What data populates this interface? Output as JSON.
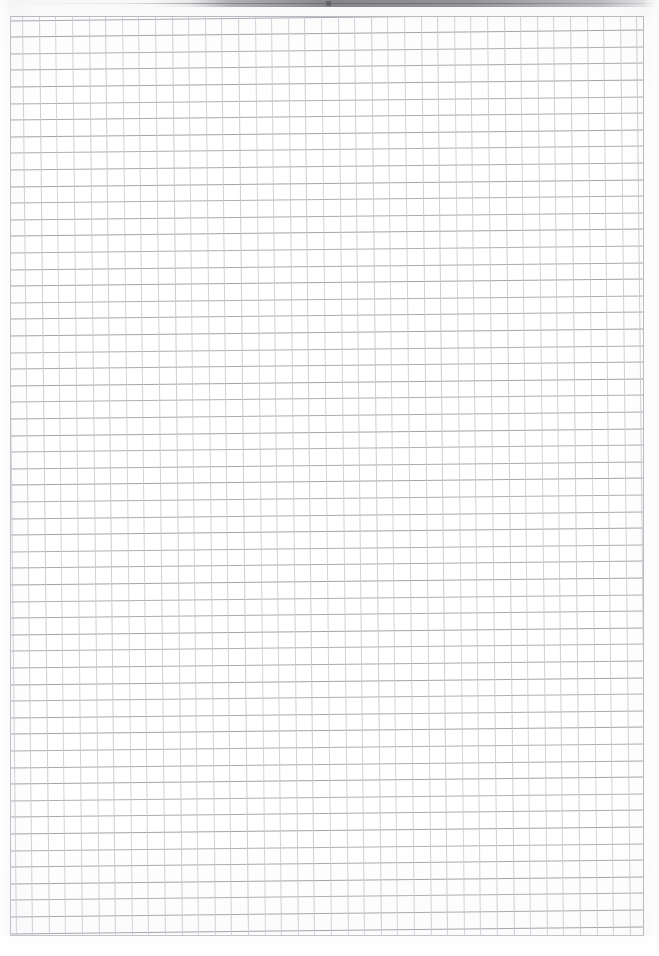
{
  "document": {
    "kind": "scanned-grid-paper",
    "title": "Blank squared notebook page",
    "page_width": 659,
    "page_height": 956,
    "text_content": "",
    "has_text": false,
    "has_handwriting": false,
    "orientation": "portrait"
  },
  "paper": {
    "background_color": "#fefefe",
    "surface_tone": "#fbfbfc",
    "margin_left": 10,
    "margin_top": 16,
    "margin_right": 15,
    "margin_bottom": 20
  },
  "grid": {
    "label": "square grid ruling",
    "cell_size_px": 16.6,
    "origin_x": 10,
    "origin_y": 16,
    "width": 634,
    "height": 920,
    "columns": 38,
    "rows": 55,
    "horizontal_line_color": "#9b9ba2",
    "vertical_line_color": "#c9c9d0",
    "frame_color": "#b9b9c1",
    "line_weight_px": 1,
    "skew_degrees": -0.62
  },
  "scan_artifacts": {
    "top_shadow_label": "scanner lid edge shadow",
    "top_shadow_color": "#6c6c73",
    "top_shadow_start_x": 150,
    "top_shadow_end_x": 659,
    "top_shadow_height": 7,
    "nick_x": 326,
    "nick_y": 1
  }
}
